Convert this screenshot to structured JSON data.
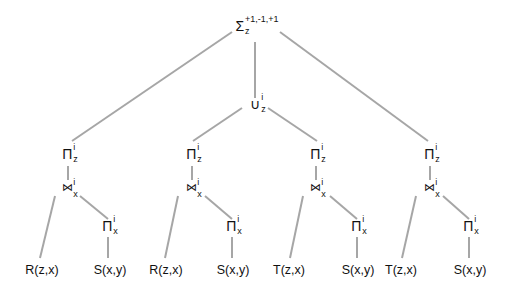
{
  "diagram": {
    "type": "query-plan-tree",
    "root": {
      "symbol": "Σ",
      "subscript": "z",
      "superscript": "+1,-1,+1"
    },
    "union": {
      "symbol": "∪",
      "subscript": "z",
      "superscript": "i"
    },
    "branches": [
      {
        "project_z": {
          "symbol": "Π",
          "subscript": "z",
          "superscript": "i"
        },
        "join": {
          "symbol": "⋈",
          "subscript": "x",
          "superscript": "i"
        },
        "project_x": {
          "symbol": "Π",
          "subscript": "x",
          "superscript": "i"
        },
        "left_leaf": "R(z,x)",
        "right_leaf": "S(x,y)"
      },
      {
        "project_z": {
          "symbol": "Π",
          "subscript": "z",
          "superscript": "i"
        },
        "join": {
          "symbol": "⋈",
          "subscript": "x",
          "superscript": "i"
        },
        "project_x": {
          "symbol": "Π",
          "subscript": "x",
          "superscript": "i"
        },
        "left_leaf": "R(z,x)",
        "right_leaf": "S(x,y)"
      },
      {
        "project_z": {
          "symbol": "Π",
          "subscript": "z",
          "superscript": "i"
        },
        "join": {
          "symbol": "⋈",
          "subscript": "x",
          "superscript": "i"
        },
        "project_x": {
          "symbol": "Π",
          "subscript": "x",
          "superscript": "i"
        },
        "left_leaf": "T(z,x)",
        "right_leaf": "S(x,y)"
      },
      {
        "project_z": {
          "symbol": "Π",
          "subscript": "z",
          "superscript": "i"
        },
        "join": {
          "symbol": "⋈",
          "subscript": "x",
          "superscript": "i"
        },
        "project_x": {
          "symbol": "Π",
          "subscript": "x",
          "superscript": "i"
        },
        "left_leaf": "T(z,x)",
        "right_leaf": "S(x,y)"
      }
    ],
    "edge_color": "#a6a6a6"
  }
}
